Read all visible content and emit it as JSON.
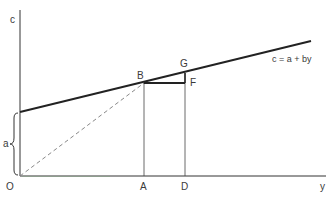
{
  "diagram": {
    "title": "",
    "axes": {
      "vertical_label": "c",
      "horizontal_label": "y",
      "origin_label": "O"
    },
    "line": {
      "equation_label": "c = a + by",
      "intercept_label": "a"
    },
    "points": {
      "B": "B",
      "G": "G",
      "F": "F",
      "A": "A",
      "D": "D"
    },
    "colors": {
      "ink": "#2a2a2a",
      "dashed": "#888888",
      "axis_tint": "#6b8a6b"
    }
  }
}
